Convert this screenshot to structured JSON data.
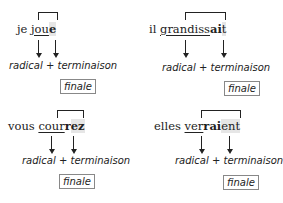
{
  "examples": [
    {
      "pronoun": "je",
      "radical": "jou",
      "terminaison_bold": "e",
      "highlight": "e",
      "radical_label": "radical",
      "plus": "+",
      "terminaison_label": "terminaison",
      "finale_label": "finale"
    },
    {
      "pronoun": "il",
      "radical": "grandiss",
      "terminaison_bold": "ai",
      "highlight": "t",
      "radical_label": "radical",
      "plus": "+",
      "terminaison_label": "terminaison",
      "finale_label": "finale"
    },
    {
      "pronoun": "vous",
      "radical": "cour",
      "terminaison_bold": "r",
      "highlight": "ez",
      "radical_label": "radical",
      "plus": "+",
      "terminaison_label": "terminaison",
      "finale_label": "finale"
    },
    {
      "pronoun": "elles",
      "radical": "ver",
      "terminaison_bold": "rai",
      "highlight": "ent",
      "radical_label": "radical",
      "plus": "+",
      "terminaison_label": "terminaison",
      "finale_label": "finale"
    }
  ]
}
